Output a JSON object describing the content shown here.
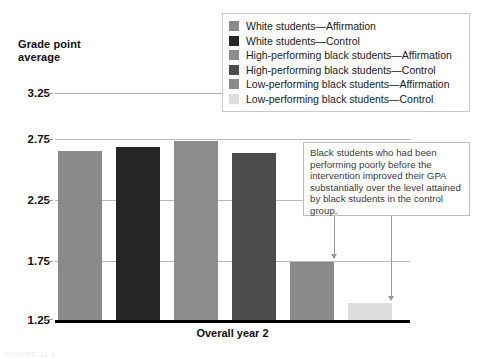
{
  "axis": {
    "y_title_line1": "Grade point",
    "y_title_line2": "average",
    "x_title": "Overall year 2",
    "y_ticks": [
      "3.25",
      "2.75",
      "2.25",
      "1.75",
      "1.25"
    ]
  },
  "legend": {
    "items": [
      {
        "label": "White students—Affirmation",
        "color": "#8a8a8a"
      },
      {
        "label": "White students—Control",
        "color": "#252525"
      },
      {
        "label": "High-performing black students—Affirmation",
        "color": "#8d8d8d"
      },
      {
        "label": "High-performing black students—Control",
        "color": "#4b4b4b"
      },
      {
        "label": "Low-performing black students—Affirmation",
        "color": "#8a8a8a"
      },
      {
        "label": "Low-performing black students—Control",
        "color": "#dddddd"
      }
    ]
  },
  "callout": {
    "text": "Black students who had been performing poorly before the intervention improved their GPA substantially over the level attained by black students in the control group."
  },
  "figure_caption": "FIGURE 11.1",
  "chart_data": {
    "type": "bar",
    "title": "",
    "xlabel": "Overall year 2",
    "ylabel": "Grade point average",
    "ylim": [
      1.25,
      3.25
    ],
    "yticks": [
      1.25,
      1.75,
      2.25,
      2.75,
      3.25
    ],
    "grid": true,
    "legend_position": "top-right",
    "categories": [
      "White students—Affirmation",
      "White students—Control",
      "High-performing black students—Affirmation",
      "High-performing black students—Control",
      "Low-performing black students—Affirmation",
      "Low-performing black students—Control"
    ],
    "values": [
      2.74,
      2.77,
      2.83,
      2.72,
      1.76,
      1.4
    ],
    "colors": [
      "#8a8a8a",
      "#252525",
      "#8d8d8d",
      "#4b4b4b",
      "#8a8a8a",
      "#dddddd"
    ],
    "annotations": [
      {
        "text": "Black students who had been performing poorly before the intervention improved their GPA substantially over the level attained by black students in the control group.",
        "points_to": [
          "Low-performing black students—Affirmation",
          "Low-performing black students—Control"
        ]
      }
    ]
  }
}
